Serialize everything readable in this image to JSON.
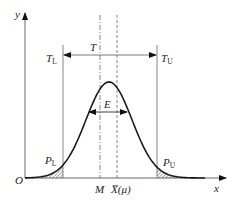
{
  "diagram": {
    "type": "normal-distribution-tolerance",
    "axes": {
      "x_label": "x",
      "y_label": "y",
      "origin_label": "O"
    },
    "tolerance": {
      "lower_limit": {
        "label": "T",
        "subscript": "L"
      },
      "upper_limit": {
        "label": "T",
        "subscript": "U"
      },
      "range_label": "T"
    },
    "center_offset": {
      "label": "E"
    },
    "markers": {
      "tolerance_center": {
        "label": "M",
        "line_style": "dash-dot"
      },
      "mean": {
        "label": "X̅(μ)",
        "line_style": "dashed"
      }
    },
    "tails": {
      "lower": {
        "label": "P",
        "subscript": "L",
        "fill": "hatched"
      },
      "upper": {
        "label": "P",
        "subscript": "U",
        "fill": "hatched"
      }
    },
    "colors": {
      "curve": "#1a1a1a",
      "lines": "#555555",
      "background": "#ffffff"
    }
  }
}
